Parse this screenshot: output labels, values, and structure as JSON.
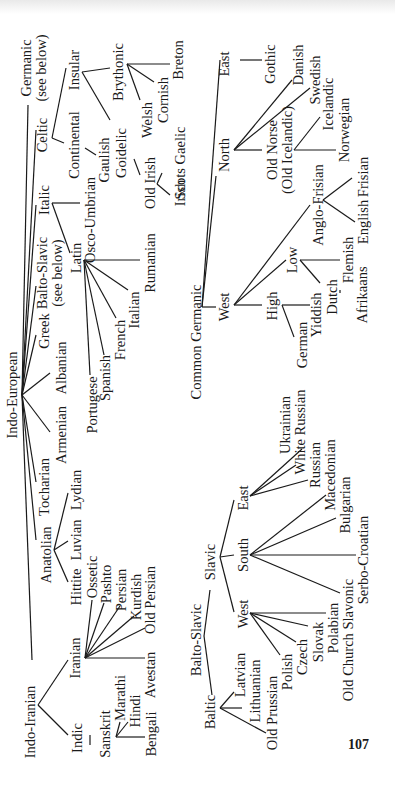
{
  "page": {
    "number": "107",
    "orientation": "rotated 90° counter-clockwise"
  },
  "diagram": {
    "title": "Indo-European",
    "nodes": {
      "indo_european": "Indo-European",
      "indo_iranian": "Indo-Iranian",
      "indic": "Indic",
      "sanskrit": "Sanskrit",
      "marathi": "Marathi",
      "hindi": "Hindi",
      "bengali": "Bengali",
      "iranian": "Iranian",
      "ossetic": "Ossetic",
      "pashto": "Pashto",
      "persian": "Persian",
      "kurdish": "Kurdish",
      "old_persian": "Old Persian",
      "avestan": "Avestan",
      "anatolian": "Anatolian",
      "hittite": "Hittite",
      "luvian": "Luvian",
      "lydian": "Lydian",
      "tocharian": "Tocharian",
      "armenian": "Armenian",
      "albanian": "Albanian",
      "greek": "Greek",
      "balto_slavic_ref": "Balto-Slavic",
      "see_below_1": "(see below)",
      "italic": "Italic",
      "latin": "Latin",
      "portugese": "Portugese",
      "spanish": "Spanish",
      "french": "French",
      "italian": "Italian",
      "rumanian": "Rumanian",
      "osco_umbrian": "Osco-Umbrian",
      "celtic": "Celtic",
      "continental": "Continental",
      "gaulish": "Gaulish",
      "insular": "Insular",
      "goidelic": "Goidelic",
      "old_irish": "Old Irish",
      "irish": "Irish",
      "scots_gaelic": "Scots Gaelic",
      "brythonic": "Brythonic",
      "welsh": "Welsh",
      "cornish": "Cornish",
      "breton": "Breton",
      "germanic_ref": "Germanic",
      "see_below_2": "(see below)",
      "common_germanic": "Common Germanic",
      "west": "West",
      "high": "High",
      "german": "German",
      "yiddish": "Yiddish",
      "low": "Low",
      "dutch": "Dutch",
      "afrikaans": "Afrikaans",
      "flemish": "Flemish",
      "anglo_frisian": "Anglo-Frisian",
      "english": "English",
      "frisian": "Frisian",
      "north": "North",
      "old_norse": "Old Norse",
      "old_icelandic": "(Old Icelandic)",
      "icelandic": "Icelandic",
      "norwegian": "Norwegian",
      "danish": "Danish",
      "swedish": "Swedish",
      "east": "East",
      "gothic": "Gothic",
      "balto_slavic": "Balto-Slavic",
      "baltic": "Baltic",
      "latvian": "Latvian",
      "lithuanian": "Lithuanian",
      "old_prussian": "Old Prussian",
      "slavic": "Slavic",
      "slavic_west": "West",
      "polish": "Polish",
      "czech": "Czech",
      "slovak": "Slovak",
      "polabian": "Polabian",
      "old_church_slavonic": "Old Church Slavonic",
      "slavic_south": "South",
      "serbo_croatian": "Serbo-Croatian",
      "bulgarian": "Bulgarian",
      "macedonian": "Macedonian",
      "slavic_east": "East",
      "russian": "Russian",
      "white_russian": "White Russian",
      "ukrainian": "Ukrainian"
    },
    "subtrees": [
      "Indo-European",
      "Common Germanic",
      "Balto-Slavic"
    ]
  }
}
